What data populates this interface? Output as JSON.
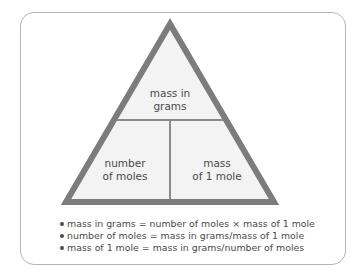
{
  "diagram": {
    "type": "formula-triangle",
    "colors": {
      "frame_border": "#b5b5b5",
      "triangle_stroke": "#7c7c7c",
      "triangle_fill": "#f3f3f3",
      "divider": "#8a8a8a",
      "text": "#4a4a4a"
    },
    "sections": {
      "top": {
        "line1": "mass in",
        "line2": "grams"
      },
      "bottom_left": {
        "line1": "number",
        "line2": "of moles"
      },
      "bottom_right": {
        "line1": "mass",
        "line2": "of 1 mole"
      }
    },
    "formulas": [
      "mass in grams = number of moles × mass of 1 mole",
      "number of moles = mass in grams/mass of 1 mole",
      "mass of 1 mole = mass in grams/number of moles"
    ]
  }
}
